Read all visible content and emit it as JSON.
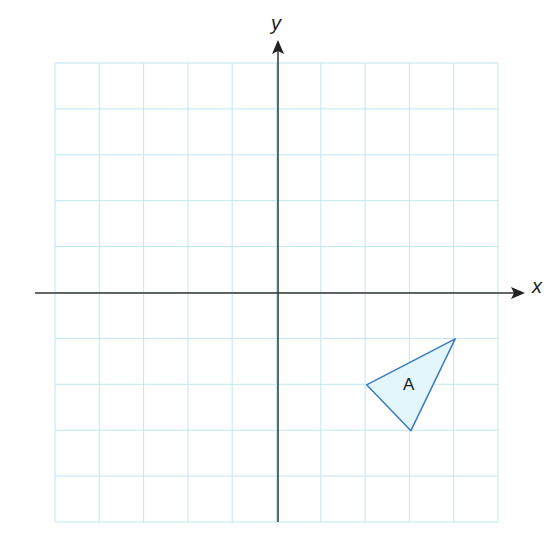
{
  "diagram": {
    "type": "coordinate-grid",
    "x_axis_label": "x",
    "y_axis_label": "y",
    "grid": {
      "x_min": -5,
      "x_max": 5,
      "y_min": -5,
      "y_max": 5
    },
    "shapes": [
      {
        "name": "A",
        "type": "triangle",
        "vertices": [
          [
            2,
            -2
          ],
          [
            4,
            -1
          ],
          [
            3,
            -3
          ]
        ],
        "fill": "#e3f6fb",
        "stroke": "#3a7bbf"
      }
    ]
  },
  "colors": {
    "grid": "#bfe8f0",
    "axes": "#333333",
    "triangle_fill": "#e3f6fb",
    "triangle_stroke": "#3a7bbf"
  }
}
